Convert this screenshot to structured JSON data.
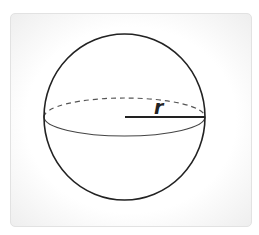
{
  "figure": {
    "label_radius": "r",
    "colors": {
      "stroke": "#222222",
      "equator_stroke": "#444444",
      "dashed_stroke": "#555555",
      "card_border": "#e2e2e2"
    }
  }
}
